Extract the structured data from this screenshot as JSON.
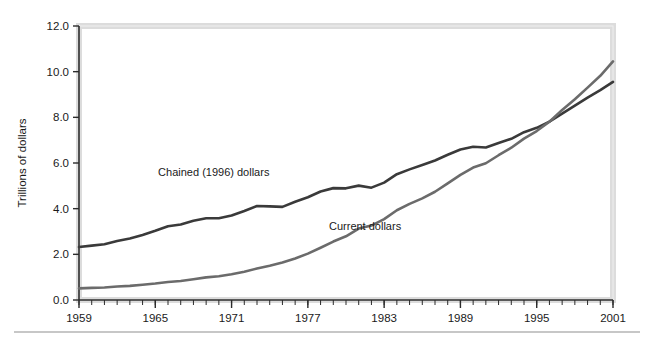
{
  "chart_data": {
    "type": "line",
    "title": "",
    "xlabel": "",
    "ylabel": "Trillions of dollars",
    "xlim": [
      1959,
      2001
    ],
    "ylim": [
      0.0,
      12.0
    ],
    "grid": false,
    "legend_position": "inline-annotations",
    "ytick_labels": [
      "0.0",
      "2.0",
      "4.0",
      "6.0",
      "8.0",
      "10.0",
      "12.0"
    ],
    "ytick_values": [
      0.0,
      2.0,
      4.0,
      6.0,
      8.0,
      10.0,
      12.0
    ],
    "xtick_labels": [
      "1959",
      "1965",
      "1971",
      "1977",
      "1983",
      "1989",
      "1995",
      "2001"
    ],
    "xtick_values": [
      1959,
      1965,
      1971,
      1977,
      1983,
      1989,
      1995,
      2001
    ],
    "minor_xticks_every": 1,
    "x": [
      1959,
      1960,
      1961,
      1962,
      1963,
      1964,
      1965,
      1966,
      1967,
      1968,
      1969,
      1970,
      1971,
      1972,
      1973,
      1974,
      1975,
      1976,
      1977,
      1978,
      1979,
      1980,
      1981,
      1982,
      1983,
      1984,
      1985,
      1986,
      1987,
      1988,
      1989,
      1990,
      1991,
      1992,
      1993,
      1994,
      1995,
      1996,
      1997,
      1998,
      1999,
      2000,
      2001
    ],
    "series": [
      {
        "name": "Chained (1996) dollars",
        "color": "#3a3a3a",
        "label_x": 1969.6,
        "label_y": 5.45,
        "values": [
          2.32,
          2.38,
          2.44,
          2.58,
          2.69,
          2.85,
          3.03,
          3.23,
          3.31,
          3.47,
          3.58,
          3.58,
          3.7,
          3.9,
          4.12,
          4.1,
          4.08,
          4.3,
          4.5,
          4.75,
          4.9,
          4.89,
          5.01,
          4.92,
          5.14,
          5.51,
          5.72,
          5.91,
          6.11,
          6.36,
          6.59,
          6.71,
          6.68,
          6.88,
          7.06,
          7.35,
          7.54,
          7.81,
          8.16,
          8.51,
          8.86,
          9.19,
          9.55
        ]
      },
      {
        "name": "Current dollars",
        "color": "#6b6b6b",
        "label_x": 1981.5,
        "label_y": 3.05,
        "values": [
          0.51,
          0.53,
          0.55,
          0.59,
          0.62,
          0.67,
          0.72,
          0.79,
          0.83,
          0.91,
          0.99,
          1.04,
          1.13,
          1.24,
          1.38,
          1.5,
          1.64,
          1.82,
          2.03,
          2.29,
          2.56,
          2.79,
          3.13,
          3.26,
          3.54,
          3.93,
          4.21,
          4.45,
          4.74,
          5.11,
          5.48,
          5.8,
          5.99,
          6.34,
          6.67,
          7.07,
          7.4,
          7.81,
          8.32,
          8.79,
          9.3,
          9.82,
          10.45
        ]
      }
    ]
  },
  "figure": {
    "background_color": "#ffffff",
    "frame_color": "#d8d8d8",
    "axis_color": "#2b2b2b",
    "bottom_rule_color": "#b5b5b5"
  }
}
